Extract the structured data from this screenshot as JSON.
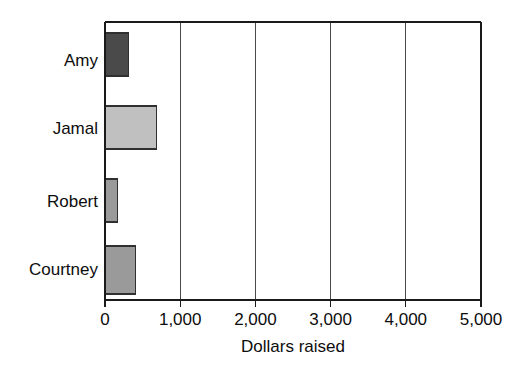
{
  "chart_data": {
    "type": "bar",
    "orientation": "horizontal",
    "title": "",
    "subtitle": "",
    "xlabel": "Dollars raised",
    "ylabel": "",
    "categories": [
      "Amy",
      "Jamal",
      "Robert",
      "Courtney"
    ],
    "values": [
      310,
      690,
      170,
      410
    ],
    "series": [
      {
        "name": "Dollars raised",
        "values": [
          310,
          690,
          170,
          410
        ]
      }
    ],
    "xlim": [
      0,
      5000
    ],
    "ylim": [
      0,
      4
    ],
    "xticks": [
      0,
      1000,
      2000,
      3000,
      4000,
      5000
    ],
    "xtick_labels": [
      "0",
      "1,000",
      "2,000",
      "3,000",
      "4,000",
      "5,000"
    ],
    "grid": "vertical",
    "legend": "none",
    "bar_colors": [
      "#4a4a4a",
      "#c0c0c0",
      "#9a9a9a",
      "#9a9a9a"
    ],
    "bar_edge_color": "#303030",
    "background_color": "#ffffff",
    "axis_color": "#1a1a1a",
    "annotations": []
  },
  "axis": {
    "x_title": "Dollars raised",
    "tick_labels": [
      "0",
      "1,000",
      "2,000",
      "3,000",
      "4,000",
      "5,000"
    ]
  },
  "bars": [
    {
      "label": "Amy",
      "value": 310,
      "color": "#4a4a4a"
    },
    {
      "label": "Jamal",
      "value": 690,
      "color": "#c0c0c0"
    },
    {
      "label": "Robert",
      "value": 170,
      "color": "#9a9a9a"
    },
    {
      "label": "Courtney",
      "value": 410,
      "color": "#9a9a9a"
    }
  ]
}
